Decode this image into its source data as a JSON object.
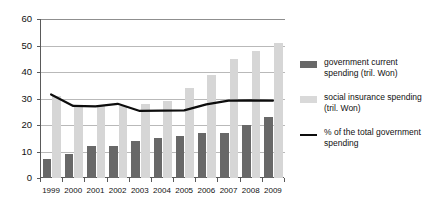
{
  "chart_data": {
    "type": "bar",
    "title": "",
    "xlabel": "",
    "ylabel": "",
    "ylim": [
      0,
      60
    ],
    "ytick_step": 10,
    "yticks": [
      0,
      10,
      20,
      30,
      40,
      50,
      60
    ],
    "grid": true,
    "legend_position": "right",
    "categories": [
      "1999",
      "2000",
      "2001",
      "2002",
      "2003",
      "2004",
      "2005",
      "2006",
      "2007",
      "2008",
      "2009"
    ],
    "series": [
      {
        "name": "government current spending (tril. Won)",
        "type": "bar",
        "color": "#686868",
        "values": [
          7,
          9,
          12,
          12,
          14,
          15,
          16,
          17,
          17,
          20,
          23
        ]
      },
      {
        "name": "social insurance spending (tril. Won)",
        "type": "bar",
        "color": "#d6d6d6",
        "values": [
          31,
          27,
          27,
          27,
          28,
          29,
          34,
          39,
          45,
          48,
          51
        ]
      },
      {
        "name": "% of the total government spending",
        "type": "line",
        "color": "#0d0d0d",
        "values": [
          31.5,
          27.2,
          27.0,
          28.0,
          25.3,
          25.4,
          25.5,
          27.8,
          29.2,
          29.3,
          29.2
        ]
      }
    ]
  },
  "legend": {
    "items": [
      {
        "swatch": "dark-square-swatch",
        "label": "government current spending (tril. Won)"
      },
      {
        "swatch": "light-square-swatch",
        "label": "social insurance spending (tril. Won)"
      },
      {
        "swatch": "black-line-swatch",
        "label": "% of the total government spending"
      }
    ]
  },
  "colors": {
    "bar_dark": "#686868",
    "bar_light": "#d6d6d6",
    "line": "#0d0d0d",
    "grid": "#b9b9b9",
    "axis": "#5a5a5a",
    "background": "#ffffff"
  }
}
